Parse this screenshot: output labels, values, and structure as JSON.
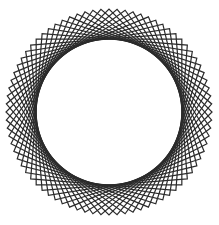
{
  "figure": {
    "type": "geometric-line-figure",
    "background_color": "#ffffff",
    "stroke_color": "#2b2b2b",
    "stroke_width": 1.2,
    "canvas": {
      "width": 219,
      "height": 225
    }
  },
  "chart_data": {
    "type": "line",
    "subtitle": "",
    "xlabel": "",
    "ylabel": "",
    "grid": false,
    "legend": false,
    "axis_visible": false,
    "tick_labels": [],
    "annotations": [],
    "geometry": {
      "shape": "square",
      "count": 20,
      "center_x": 109,
      "center_y": 112,
      "circumradius": 103,
      "inner_envelope_radius": 53,
      "rotation_step_degrees": 4.5,
      "start_rotation_degrees": 0,
      "total_rotation_degrees": 90,
      "outer_points": 20,
      "vertices_per_shape": 4
    },
    "bounds": {
      "left": 8,
      "top": 8,
      "right": 211,
      "bottom": 216
    },
    "series": [
      {
        "name": "square-00",
        "rotation": 0.0
      },
      {
        "name": "square-01",
        "rotation": 4.5
      },
      {
        "name": "square-02",
        "rotation": 9.0
      },
      {
        "name": "square-03",
        "rotation": 13.5
      },
      {
        "name": "square-04",
        "rotation": 18.0
      },
      {
        "name": "square-05",
        "rotation": 22.5
      },
      {
        "name": "square-06",
        "rotation": 27.0
      },
      {
        "name": "square-07",
        "rotation": 31.5
      },
      {
        "name": "square-08",
        "rotation": 36.0
      },
      {
        "name": "square-09",
        "rotation": 40.5
      },
      {
        "name": "square-10",
        "rotation": 45.0
      },
      {
        "name": "square-11",
        "rotation": 49.5
      },
      {
        "name": "square-12",
        "rotation": 54.0
      },
      {
        "name": "square-13",
        "rotation": 58.5
      },
      {
        "name": "square-14",
        "rotation": 63.0
      },
      {
        "name": "square-15",
        "rotation": 67.5
      },
      {
        "name": "square-16",
        "rotation": 72.0
      },
      {
        "name": "square-17",
        "rotation": 76.5
      },
      {
        "name": "square-18",
        "rotation": 81.0
      },
      {
        "name": "square-19",
        "rotation": 85.5
      }
    ]
  }
}
